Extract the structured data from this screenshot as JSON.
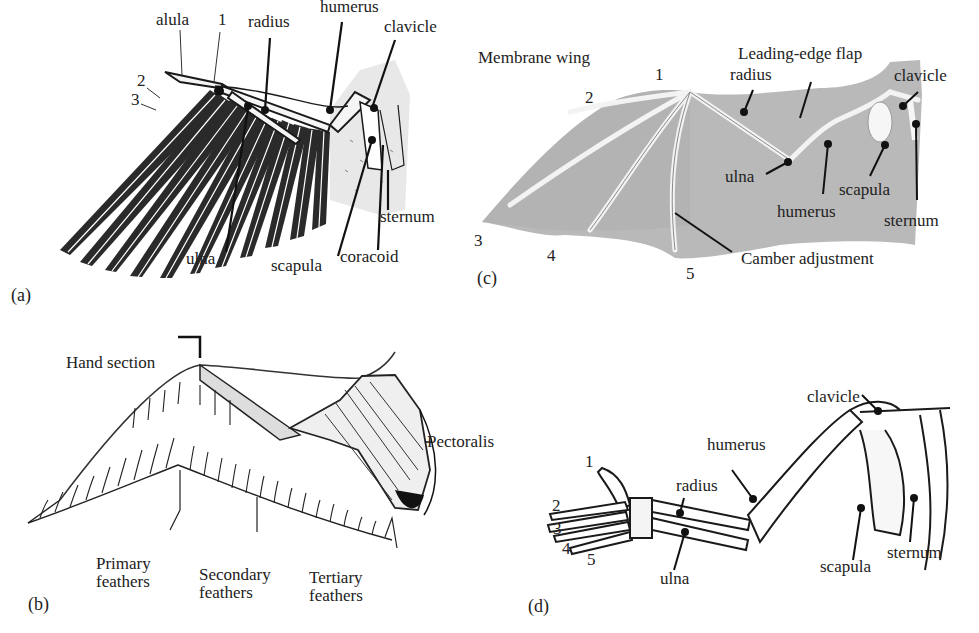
{
  "figure": {
    "panels": [
      {
        "id": "a",
        "tag": "(a)",
        "subject": "bird wing skeleton",
        "labels": [
          {
            "key": "alula",
            "text": "alula",
            "x": 156,
            "y": 11
          },
          {
            "key": "digit-1",
            "text": "1",
            "x": 218,
            "y": 11
          },
          {
            "key": "digit-2",
            "text": "2",
            "x": 137,
            "y": 72
          },
          {
            "key": "digit-3",
            "text": "3",
            "x": 131,
            "y": 91
          },
          {
            "key": "radius",
            "text": "radius",
            "x": 248,
            "y": 13
          },
          {
            "key": "humerus",
            "text": "humerus",
            "x": 320,
            "y": -2
          },
          {
            "key": "clavicle",
            "text": "clavicle",
            "x": 384,
            "y": 18
          },
          {
            "key": "sternum",
            "text": "sternum",
            "x": 380,
            "y": 208
          },
          {
            "key": "ulna",
            "text": "ulna",
            "x": 186,
            "y": 250
          },
          {
            "key": "scapula",
            "text": "scapula",
            "x": 271,
            "y": 257
          },
          {
            "key": "coracoid",
            "text": "coracoid",
            "x": 340,
            "y": 248
          }
        ]
      },
      {
        "id": "b",
        "tag": "(b)",
        "subject": "bird wing musculature and feathers",
        "labels": [
          {
            "key": "hand-section",
            "text": "Hand section",
            "x": 66,
            "y": 354
          },
          {
            "key": "pectoralis",
            "text": "Pectoralis",
            "x": 427,
            "y": 433
          },
          {
            "key": "primary-feathers",
            "text": "Primary\nfeathers",
            "x": 96,
            "y": 555
          },
          {
            "key": "secondary-feathers",
            "text": "Secondary\nfeathers",
            "x": 199,
            "y": 566
          },
          {
            "key": "tertiary-feathers",
            "text": "Tertiary\nfeathers",
            "x": 309,
            "y": 569
          }
        ]
      },
      {
        "id": "c",
        "tag": "(c)",
        "subject": "bat membrane wing",
        "labels": [
          {
            "key": "membrane-wing",
            "text": "Membrane wing",
            "x": 478,
            "y": 49
          },
          {
            "key": "leading-edge-flap",
            "text": "Leading-edge flap",
            "x": 738,
            "y": 45
          },
          {
            "key": "digit-1",
            "text": "1",
            "x": 655,
            "y": 66
          },
          {
            "key": "digit-2",
            "text": "2",
            "x": 585,
            "y": 89
          },
          {
            "key": "radius",
            "text": "radius",
            "x": 730,
            "y": 66
          },
          {
            "key": "clavicle",
            "text": "clavicle",
            "x": 894,
            "y": 67
          },
          {
            "key": "ulna",
            "text": "ulna",
            "x": 725,
            "y": 168
          },
          {
            "key": "humerus",
            "text": "humerus",
            "x": 777,
            "y": 203
          },
          {
            "key": "scapula",
            "text": "scapula",
            "x": 839,
            "y": 181
          },
          {
            "key": "sternum",
            "text": "sternum",
            "x": 884,
            "y": 212
          },
          {
            "key": "digit-3",
            "text": "3",
            "x": 474,
            "y": 232
          },
          {
            "key": "digit-4",
            "text": "4",
            "x": 547,
            "y": 247
          },
          {
            "key": "digit-5",
            "text": "5",
            "x": 686,
            "y": 265
          },
          {
            "key": "camber-adjustment",
            "text": "Camber adjustment",
            "x": 741,
            "y": 250
          }
        ]
      },
      {
        "id": "d",
        "tag": "(d)",
        "subject": "human arm skeleton",
        "labels": [
          {
            "key": "clavicle",
            "text": "clavicle",
            "x": 807,
            "y": 388
          },
          {
            "key": "humerus",
            "text": "humerus",
            "x": 707,
            "y": 436
          },
          {
            "key": "radius",
            "text": "radius",
            "x": 676,
            "y": 477
          },
          {
            "key": "digit-1",
            "text": "1",
            "x": 585,
            "y": 453
          },
          {
            "key": "digit-2",
            "text": "2",
            "x": 552,
            "y": 497
          },
          {
            "key": "digit-3",
            "text": "3",
            "x": 553,
            "y": 520
          },
          {
            "key": "digit-4",
            "text": "4",
            "x": 562,
            "y": 540
          },
          {
            "key": "digit-5",
            "text": "5",
            "x": 587,
            "y": 551
          },
          {
            "key": "ulna",
            "text": "ulna",
            "x": 660,
            "y": 570
          },
          {
            "key": "scapula",
            "text": "scapula",
            "x": 820,
            "y": 558
          },
          {
            "key": "sternum",
            "text": "sternum",
            "x": 887,
            "y": 544
          }
        ]
      }
    ],
    "tags_pos": {
      "a": [
        11,
        285
      ],
      "b": [
        28,
        592
      ],
      "c": [
        477,
        268
      ],
      "d": [
        528,
        594
      ]
    },
    "colors": {
      "ink": "#1a1a1a",
      "membrane": "#b9b9b9",
      "membrane_dark": "#a7a7a7",
      "bone_light": "#f0f0f0",
      "paper": "#ffffff"
    }
  }
}
